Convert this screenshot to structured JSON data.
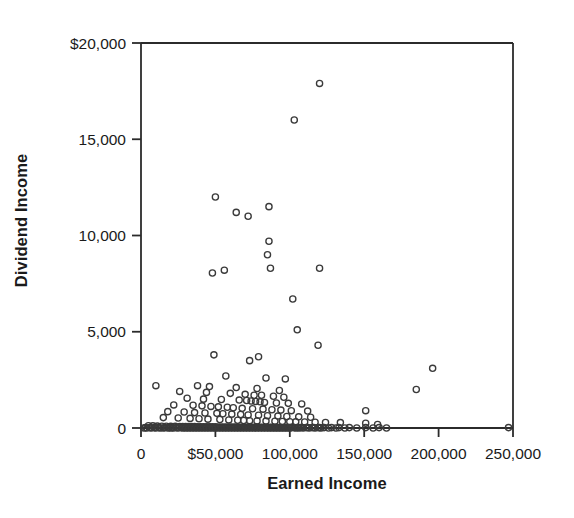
{
  "chart_data": {
    "type": "scatter",
    "title": "",
    "xlabel": "Earned Income",
    "ylabel": "Dividend Income",
    "xlim": [
      0,
      250000
    ],
    "ylim": [
      0,
      20000
    ],
    "grid": false,
    "legend": null,
    "marker": "open-circle",
    "marker_color": "#3a3a3a",
    "xticks": [
      0,
      50000,
      100000,
      150000,
      200000,
      250000
    ],
    "xtick_labels": [
      "0",
      "$50,000",
      "100,000",
      "150,000",
      "200,000",
      "250,000"
    ],
    "yticks": [
      0,
      5000,
      10000,
      15000,
      20000
    ],
    "ytick_labels": [
      "0",
      "5,000",
      "10,000",
      "15,000",
      "$20,000"
    ],
    "points": [
      [
        120000,
        17900
      ],
      [
        103000,
        16000
      ],
      [
        86000,
        11500
      ],
      [
        72000,
        11000
      ],
      [
        50000,
        12000
      ],
      [
        64000,
        11200
      ],
      [
        86000,
        9700
      ],
      [
        85000,
        9000
      ],
      [
        87000,
        8300
      ],
      [
        120000,
        8300
      ],
      [
        56000,
        8200
      ],
      [
        48000,
        8050
      ],
      [
        102000,
        6700
      ],
      [
        105000,
        5100
      ],
      [
        119000,
        4300
      ],
      [
        49000,
        3800
      ],
      [
        79000,
        3700
      ],
      [
        73000,
        3500
      ],
      [
        196000,
        3100
      ],
      [
        57000,
        2700
      ],
      [
        84000,
        2600
      ],
      [
        97000,
        2550
      ],
      [
        10000,
        2200
      ],
      [
        38000,
        2200
      ],
      [
        46000,
        2150
      ],
      [
        64000,
        2100
      ],
      [
        78000,
        2050
      ],
      [
        93000,
        1950
      ],
      [
        185000,
        2000
      ],
      [
        26000,
        1900
      ],
      [
        44000,
        1850
      ],
      [
        60000,
        1800
      ],
      [
        70000,
        1750
      ],
      [
        76000,
        1700
      ],
      [
        81000,
        1700
      ],
      [
        89000,
        1650
      ],
      [
        96000,
        1600
      ],
      [
        31000,
        1550
      ],
      [
        42000,
        1500
      ],
      [
        54000,
        1480
      ],
      [
        66000,
        1450
      ],
      [
        71000,
        1430
      ],
      [
        74000,
        1400
      ],
      [
        77000,
        1380
      ],
      [
        80000,
        1360
      ],
      [
        83000,
        1330
      ],
      [
        91000,
        1300
      ],
      [
        99000,
        1280
      ],
      [
        108000,
        1250
      ],
      [
        22000,
        1200
      ],
      [
        35000,
        1180
      ],
      [
        41000,
        1150
      ],
      [
        47000,
        1120
      ],
      [
        52000,
        1100
      ],
      [
        58000,
        1080
      ],
      [
        62000,
        1050
      ],
      [
        68000,
        1020
      ],
      [
        75000,
        1000
      ],
      [
        82000,
        980
      ],
      [
        88000,
        950
      ],
      [
        94000,
        930
      ],
      [
        101000,
        900
      ],
      [
        112000,
        880
      ],
      [
        18000,
        850
      ],
      [
        29000,
        830
      ],
      [
        36000,
        800
      ],
      [
        43000,
        780
      ],
      [
        51000,
        760
      ],
      [
        55000,
        740
      ],
      [
        61000,
        720
      ],
      [
        67000,
        700
      ],
      [
        72000,
        680
      ],
      [
        79000,
        660
      ],
      [
        85000,
        640
      ],
      [
        92000,
        620
      ],
      [
        98000,
        600
      ],
      [
        106000,
        580
      ],
      [
        114000,
        560
      ],
      [
        15000,
        540
      ],
      [
        25000,
        520
      ],
      [
        33000,
        500
      ],
      [
        39000,
        480
      ],
      [
        45000,
        460
      ],
      [
        53000,
        440
      ],
      [
        59000,
        420
      ],
      [
        65000,
        400
      ],
      [
        69000,
        390
      ],
      [
        73000,
        380
      ],
      [
        78000,
        370
      ],
      [
        84000,
        360
      ],
      [
        90000,
        350
      ],
      [
        95000,
        340
      ],
      [
        100000,
        330
      ],
      [
        104000,
        320
      ],
      [
        110000,
        310
      ],
      [
        117000,
        300
      ],
      [
        124000,
        290
      ],
      [
        134000,
        280
      ],
      [
        151000,
        900
      ],
      [
        151000,
        250
      ],
      [
        159000,
        180
      ],
      [
        5000,
        120
      ],
      [
        8000,
        110
      ],
      [
        11000,
        100
      ],
      [
        14000,
        95
      ],
      [
        17000,
        90
      ],
      [
        20000,
        88
      ],
      [
        23000,
        85
      ],
      [
        26000,
        82
      ],
      [
        28000,
        80
      ],
      [
        30000,
        78
      ],
      [
        32000,
        76
      ],
      [
        34000,
        74
      ],
      [
        36000,
        72
      ],
      [
        38000,
        70
      ],
      [
        40000,
        68
      ],
      [
        42000,
        66
      ],
      [
        44000,
        64
      ],
      [
        46000,
        62
      ],
      [
        48000,
        60
      ],
      [
        50000,
        58
      ],
      [
        52000,
        56
      ],
      [
        54000,
        54
      ],
      [
        56000,
        52
      ],
      [
        58000,
        50
      ],
      [
        60000,
        48
      ],
      [
        62000,
        46
      ],
      [
        64000,
        45
      ],
      [
        66000,
        44
      ],
      [
        68000,
        43
      ],
      [
        70000,
        42
      ],
      [
        72000,
        41
      ],
      [
        74000,
        40
      ],
      [
        76000,
        39
      ],
      [
        78000,
        38
      ],
      [
        80000,
        37
      ],
      [
        82000,
        36
      ],
      [
        84000,
        35
      ],
      [
        86000,
        34
      ],
      [
        88000,
        33
      ],
      [
        90000,
        32
      ],
      [
        92000,
        31
      ],
      [
        94000,
        30
      ],
      [
        96000,
        29
      ],
      [
        98000,
        28
      ],
      [
        100000,
        27
      ],
      [
        102000,
        26
      ],
      [
        105000,
        25
      ],
      [
        108000,
        24
      ],
      [
        112000,
        23
      ],
      [
        116000,
        22
      ],
      [
        120000,
        21
      ],
      [
        3000,
        20
      ],
      [
        6000,
        20
      ],
      [
        9000,
        20
      ],
      [
        12000,
        20
      ],
      [
        16000,
        20
      ],
      [
        19000,
        20
      ],
      [
        21000,
        20
      ],
      [
        24000,
        20
      ],
      [
        27000,
        20
      ],
      [
        29000,
        20
      ],
      [
        31000,
        20
      ],
      [
        33000,
        20
      ],
      [
        35000,
        20
      ],
      [
        37000,
        20
      ],
      [
        39000,
        20
      ],
      [
        41000,
        20
      ],
      [
        43000,
        20
      ],
      [
        45000,
        20
      ],
      [
        47000,
        20
      ],
      [
        49000,
        20
      ],
      [
        51000,
        20
      ],
      [
        53000,
        20
      ],
      [
        55000,
        20
      ],
      [
        57000,
        20
      ],
      [
        59000,
        20
      ],
      [
        61000,
        20
      ],
      [
        63000,
        20
      ],
      [
        65000,
        20
      ],
      [
        67000,
        20
      ],
      [
        69000,
        20
      ],
      [
        71000,
        20
      ],
      [
        73000,
        20
      ],
      [
        75000,
        20
      ],
      [
        77000,
        20
      ],
      [
        79000,
        20
      ],
      [
        81000,
        20
      ],
      [
        83000,
        20
      ],
      [
        85000,
        20
      ],
      [
        87000,
        20
      ],
      [
        89000,
        20
      ],
      [
        91000,
        20
      ],
      [
        93000,
        20
      ],
      [
        95000,
        20
      ],
      [
        97000,
        20
      ],
      [
        99000,
        20
      ],
      [
        101000,
        20
      ],
      [
        103000,
        20
      ],
      [
        107000,
        20
      ],
      [
        111000,
        20
      ],
      [
        115000,
        20
      ],
      [
        119000,
        20
      ],
      [
        123000,
        20
      ],
      [
        128000,
        20
      ],
      [
        133000,
        20
      ],
      [
        140000,
        20
      ],
      [
        151000,
        20
      ],
      [
        160000,
        20
      ],
      [
        247000,
        20
      ],
      [
        2000,
        0
      ],
      [
        4000,
        0
      ],
      [
        7000,
        0
      ],
      [
        10000,
        0
      ],
      [
        13000,
        0
      ],
      [
        15000,
        0
      ],
      [
        18000,
        0
      ],
      [
        20000,
        0
      ],
      [
        22000,
        0
      ],
      [
        25000,
        0
      ],
      [
        28000,
        0
      ],
      [
        30000,
        0
      ],
      [
        32000,
        0
      ],
      [
        34000,
        0
      ],
      [
        36000,
        0
      ],
      [
        38000,
        0
      ],
      [
        40000,
        0
      ],
      [
        42000,
        0
      ],
      [
        44000,
        0
      ],
      [
        46000,
        0
      ],
      [
        48000,
        0
      ],
      [
        50000,
        0
      ],
      [
        52000,
        0
      ],
      [
        54000,
        0
      ],
      [
        56000,
        0
      ],
      [
        58000,
        0
      ],
      [
        60000,
        0
      ],
      [
        62000,
        0
      ],
      [
        64000,
        0
      ],
      [
        66000,
        0
      ],
      [
        68000,
        0
      ],
      [
        70000,
        0
      ],
      [
        72000,
        0
      ],
      [
        74000,
        0
      ],
      [
        76000,
        0
      ],
      [
        78000,
        0
      ],
      [
        80000,
        0
      ],
      [
        82000,
        0
      ],
      [
        84000,
        0
      ],
      [
        86000,
        0
      ],
      [
        88000,
        0
      ],
      [
        90000,
        0
      ],
      [
        92000,
        0
      ],
      [
        94000,
        0
      ],
      [
        96000,
        0
      ],
      [
        98000,
        0
      ],
      [
        100000,
        0
      ],
      [
        104000,
        0
      ],
      [
        106000,
        0
      ],
      [
        109000,
        0
      ],
      [
        113000,
        0
      ],
      [
        117000,
        0
      ],
      [
        121000,
        0
      ],
      [
        126000,
        0
      ],
      [
        131000,
        0
      ],
      [
        137000,
        0
      ],
      [
        145000,
        0
      ],
      [
        156000,
        0
      ],
      [
        165000,
        0
      ]
    ]
  }
}
